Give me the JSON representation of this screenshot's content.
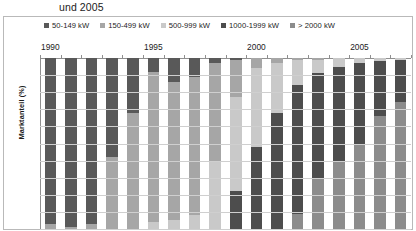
{
  "title_fragment": "und 2005",
  "axis": {
    "y_title": "Marktanteil (%)",
    "y_ticks": [
      0,
      10,
      20,
      30,
      40,
      50,
      60,
      70,
      80,
      90,
      100
    ],
    "y_inverted": true,
    "year_labels": [
      "1990",
      "1995",
      "2000",
      "2005"
    ]
  },
  "legend": {
    "items": [
      {
        "label": "50-149 kW",
        "color": "#595959"
      },
      {
        "label": "150-499 kW",
        "color": "#a6a6a6"
      },
      {
        "label": "500-999 kW",
        "color": "#c9c9c9"
      },
      {
        "label": "1000-1999 kW",
        "color": "#4d4d4d"
      },
      {
        "label": "> 2000 kW",
        "color": "#8c8c8c"
      }
    ]
  },
  "chart_data": {
    "type": "bar",
    "stacked": true,
    "orientation": "vertical",
    "title": "und 2005",
    "xlabel": "",
    "ylabel": "Marktanteil (%)",
    "ylim": [
      0,
      100
    ],
    "y_inverted": true,
    "grid": true,
    "legend_position": "top",
    "categories": [
      "1990",
      "1991",
      "1992",
      "1993",
      "1994",
      "1995",
      "1996",
      "1997",
      "1998",
      "1999",
      "2000",
      "2001",
      "2002",
      "2003",
      "2004",
      "2005",
      "2006",
      "2007"
    ],
    "series": [
      {
        "name": "50-149 kW",
        "color": "#595959",
        "values": [
          97,
          99,
          97,
          58,
          32,
          8,
          14,
          11,
          3,
          1,
          0,
          0,
          0,
          0,
          0,
          0,
          0,
          0
        ]
      },
      {
        "name": "150-499 kW",
        "color": "#a6a6a6",
        "values": [
          3,
          1,
          3,
          42,
          68,
          88,
          81,
          81,
          58,
          22,
          6,
          3,
          1,
          1,
          0,
          0,
          0,
          0
        ]
      },
      {
        "name": "500-999 kW",
        "color": "#c9c9c9",
        "values": [
          0,
          0,
          0,
          0,
          0,
          4,
          5,
          8,
          39,
          55,
          46,
          29,
          15,
          8,
          5,
          3,
          2,
          1
        ]
      },
      {
        "name": "1000-1999 kW",
        "color": "#4d4d4d",
        "values": [
          0,
          0,
          0,
          0,
          0,
          0,
          0,
          0,
          0,
          22,
          48,
          68,
          75,
          62,
          55,
          48,
          32,
          25
        ]
      },
      {
        "name": "> 2000 kW",
        "color": "#8c8c8c",
        "values": [
          0,
          0,
          0,
          0,
          0,
          0,
          0,
          0,
          0,
          0,
          0,
          0,
          9,
          29,
          40,
          49,
          66,
          74
        ]
      }
    ]
  }
}
